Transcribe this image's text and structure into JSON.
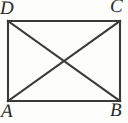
{
  "figure": {
    "kind": "geometry-diagram",
    "background_color": "#fdfdfc",
    "stroke_color": "#3a3a3a",
    "label_color": "#2b2b2b"
  },
  "labels": {
    "top_left": "D",
    "top_right": "C",
    "bottom_left": "A",
    "bottom_right": "B"
  },
  "chart_data": {
    "type": "diagram",
    "title": "",
    "shape": "rectangle-with-diagonals",
    "vertices": [
      {
        "name": "D",
        "x": 8,
        "y": 21,
        "label_position": "top-left"
      },
      {
        "name": "C",
        "x": 120,
        "y": 21,
        "label_position": "top-right"
      },
      {
        "name": "B",
        "x": 120,
        "y": 101,
        "label_position": "bottom-right"
      },
      {
        "name": "A",
        "x": 8,
        "y": 101,
        "label_position": "bottom-left"
      }
    ],
    "edges": [
      {
        "from": "D",
        "to": "C",
        "kind": "side"
      },
      {
        "from": "C",
        "to": "B",
        "kind": "side"
      },
      {
        "from": "B",
        "to": "A",
        "kind": "side"
      },
      {
        "from": "A",
        "to": "D",
        "kind": "side"
      },
      {
        "from": "A",
        "to": "C",
        "kind": "diagonal"
      },
      {
        "from": "D",
        "to": "B",
        "kind": "diagonal"
      }
    ],
    "intersection": {
      "x": 64,
      "y": 61
    },
    "stroke_width": 2,
    "grid": false,
    "legend": null
  }
}
